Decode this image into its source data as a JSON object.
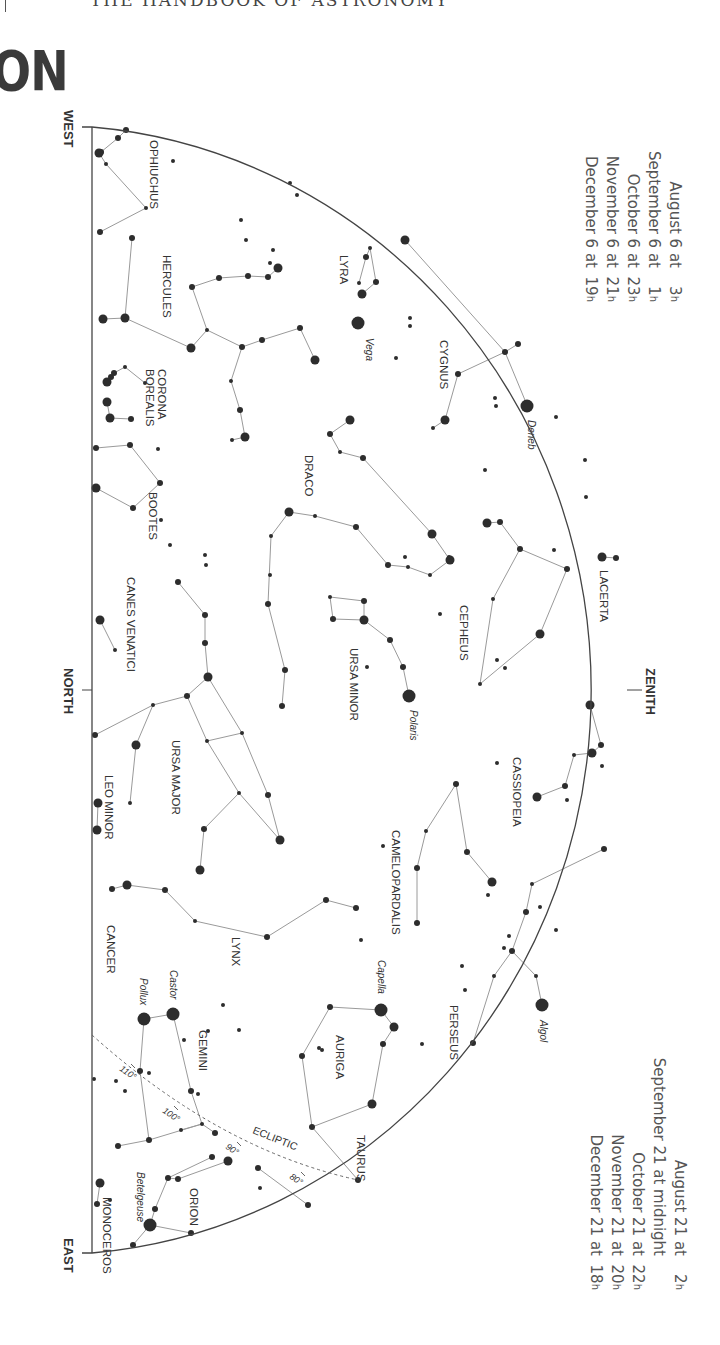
{
  "header": {
    "running_title": "THE HANDBOOK OF ASTRONOMY",
    "section_title": "ON"
  },
  "horizon_labels": {
    "west": "WEST",
    "north": "NORTH",
    "east": "EAST",
    "zenith": "ZENITH"
  },
  "times_top": [
    {
      "date": "August 6 at",
      "hour": "3",
      "unit": "h"
    },
    {
      "date": "September 6 at",
      "hour": "1",
      "unit": "h"
    },
    {
      "date": "October 6 at",
      "hour": "23",
      "unit": "h"
    },
    {
      "date": "November 6 at",
      "hour": "21",
      "unit": "h"
    },
    {
      "date": "December 6 at",
      "hour": "19",
      "unit": "h"
    }
  ],
  "times_bottom": [
    {
      "date": "August 21 at",
      "hour": "2",
      "unit": "h"
    },
    {
      "date": "September 21 at midnight",
      "hour": "",
      "unit": ""
    },
    {
      "date": "October 21 at",
      "hour": "22",
      "unit": "h"
    },
    {
      "date": "November 21 at",
      "hour": "20",
      "unit": "h"
    },
    {
      "date": "December 21 at",
      "hour": "18",
      "unit": "h"
    }
  ],
  "constellations": [
    {
      "name": "OPHIUCHUS",
      "x": 150,
      "y": 140,
      "lines": "M101,152 L118,138 L126,130 M99,153 L106,164 L146,208 L100,232"
    },
    {
      "name": "HERCULES",
      "x": 163,
      "y": 255,
      "lines": "M132,238 L125,318 L103,319 M125,318 L191,348 L207,330 L192,287 L219,278 L248,276 L268,277 L278,268 M207,330 L242,347 L262,340 L300,328 L315,360 M242,347 L231,381 L240,410 L245,437 L232,440"
    },
    {
      "name": "LYRA",
      "x": 340,
      "y": 255,
      "lines": "M359,283 L366,257 L370,248 L376,282 L362,294"
    },
    {
      "name": "CYGNUS",
      "x": 440,
      "y": 340,
      "lines": "M405,240 L505,352 L527,405 M505,352 L458,374 L445,420 L433,428 M505,352 L518,344"
    },
    {
      "name": "CORONA\nBOREALIS",
      "x": 158,
      "y": 369,
      "lines": "M107,382 L111,377 L114,373 L125,367 L145,383 M107,402 L110,418 L131,419"
    },
    {
      "name": "BOOTES",
      "x": 149,
      "y": 492,
      "lines": "M96,448 L130,445 L160,483 L133,508 L96,488"
    },
    {
      "name": "DRACO",
      "x": 305,
      "y": 455,
      "lines": "M350,420 L330,434 L340,452 L363,458 L432,534 L450,560 L430,575 L408,567 L388,565 L356,527 L315,516 L289,512 L271,536 L268,604 L285,670 L282,706"
    },
    {
      "name": "URSA MINOR",
      "x": 350,
      "y": 648,
      "lines": "M330,597 L364,601 L364,620 L333,619 L330,597 M364,620 L390,640 L403,667 L409,696"
    },
    {
      "name": "CEPHEUS",
      "x": 460,
      "y": 605,
      "lines": "M500,522 L520,549 L567,569 L540,634 L480,684 L493,599 L520,549 M487,523 L500,522"
    },
    {
      "name": "LACERTA",
      "x": 600,
      "y": 570,
      "lines": "M602,557 L616,558"
    },
    {
      "name": "CASSIOPEIA",
      "x": 513,
      "y": 757,
      "lines": "M590,705 L601,745 L592,753 L574,755 L565,786 L537,797"
    },
    {
      "name": "CANES VENATICI",
      "x": 127,
      "y": 577,
      "lines": "M100,620 L115,650"
    },
    {
      "name": "URSA MAJOR",
      "x": 172,
      "y": 740,
      "lines": "M178,582 L205,615 L205,643 L208,677 L187,696 L207,741 L242,733 L208,677 M207,741 L239,793 L280,840 L268,795 L242,733 M239,793 L204,829 L200,870 M187,696 L153,705 L136,745 L130,803 M153,705 L95,735"
    },
    {
      "name": "LEO MINOR",
      "x": 105,
      "y": 775,
      "lines": "M98,803 L97,830"
    },
    {
      "name": "LYNX",
      "x": 232,
      "y": 937,
      "lines": "M112,889 L127,885 L165,890 L195,921 L267,937 L326,900 L356,908"
    },
    {
      "name": "CANCER",
      "x": 107,
      "y": 925,
      "lines": ""
    },
    {
      "name": "CAMELOPARDALIS",
      "x": 392,
      "y": 830,
      "lines": "M417,923 L417,868 L426,831 L456,784 L467,852 L492,882"
    },
    {
      "name": "PERSEUS",
      "x": 450,
      "y": 1005,
      "lines": "M532,884 L526,912 L512,951 L494,976 L473,1043 M512,951 L536,976 L542,1005 M532,884 L604,849"
    },
    {
      "name": "AURIGA",
      "x": 336,
      "y": 1035,
      "lines": "M381,1010 L330,1007 L302,1056 L312,1127 L372,1104 L383,1044 L394,1027 L381,1010"
    },
    {
      "name": "TAURUS",
      "x": 357,
      "y": 1135,
      "lines": "M312,1127 L358,1180"
    },
    {
      "name": "GEMINI",
      "x": 199,
      "y": 1030,
      "lines": "M144,1019 L173,1014 L191,1091 L202,1124 L149,1140 L140,1071 L144,1019 M202,1124 L215,1133 M149,1140 L118,1146 M202,1124 L181,1130"
    },
    {
      "name": "ORION",
      "x": 190,
      "y": 1188,
      "lines": "M150,1225 L155,1209 L168,1178 L212,1157 M168,1178 L178,1179 L228,1161 M150,1225 L191,1233 M150,1225 L133,1245 M258,1168 L308,1205"
    },
    {
      "name": "MONOCEROS",
      "x": 103,
      "y": 1197,
      "lines": "M97,1204 L100,1183"
    }
  ],
  "named_stars": [
    {
      "name": "Vega",
      "x": 358,
      "y": 323,
      "lx": 366,
      "ly": 338
    },
    {
      "name": "Deneb",
      "x": 527,
      "y": 406,
      "lx": 528,
      "ly": 420
    },
    {
      "name": "Polaris",
      "x": 409,
      "y": 696,
      "lx": 410,
      "ly": 710
    },
    {
      "name": "Capella",
      "x": 381,
      "y": 1010,
      "lx": 378,
      "ly": 960
    },
    {
      "name": "Algol",
      "x": 542,
      "y": 1005,
      "lx": 540,
      "ly": 1020
    },
    {
      "name": "Castor",
      "x": 173,
      "y": 1014,
      "lx": 170,
      "ly": 970
    },
    {
      "name": "Pollux",
      "x": 144,
      "y": 1019,
      "lx": 140,
      "ly": 978
    },
    {
      "name": "Betelgeuse",
      "x": 150,
      "y": 1225,
      "lx": 137,
      "ly": 1172
    }
  ],
  "ecliptic": {
    "label": "ECLIPTIC",
    "ticks": [
      {
        "label": "110°",
        "x": 127,
        "y": 1070
      },
      {
        "label": "100°",
        "x": 170,
        "y": 1112
      },
      {
        "label": "90°",
        "x": 233,
        "y": 1148
      },
      {
        "label": "80°",
        "x": 297,
        "y": 1178
      }
    ]
  },
  "colors": {
    "ink": "#333333",
    "line": "#9a9a9a",
    "star": "#2d2d2d",
    "text": "#444444"
  }
}
